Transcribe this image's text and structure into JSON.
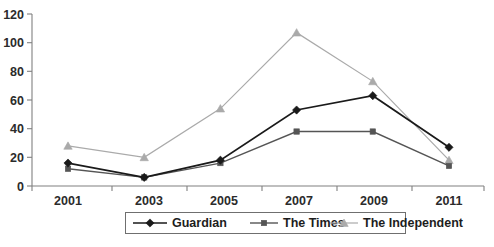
{
  "chart_data": {
    "type": "line",
    "title": "",
    "subtitle": "",
    "xlabel": "",
    "ylabel": "",
    "categories": [
      "2001",
      "2003",
      "2005",
      "2007",
      "2009",
      "2011"
    ],
    "x": [
      2001,
      2003,
      2005,
      2007,
      2009,
      2011
    ],
    "ylim": [
      0,
      120
    ],
    "yticks": [
      0,
      20,
      40,
      60,
      80,
      100,
      120
    ],
    "ytick_labels": [
      "0",
      "20",
      "40",
      "60",
      "80",
      "100",
      "120"
    ],
    "grid": false,
    "legend_position": "bottom",
    "series": [
      {
        "name": "Guardian",
        "marker": "diamond",
        "color": "#1a1a1a",
        "values": [
          16,
          6,
          18,
          53,
          63,
          27
        ]
      },
      {
        "name": "The Times",
        "marker": "square",
        "color": "#555555",
        "values": [
          12,
          6,
          16,
          38,
          38,
          14
        ]
      },
      {
        "name": "The Independent",
        "marker": "triangle",
        "color": "#aaaaaa",
        "values": [
          28,
          20,
          54,
          107,
          73,
          18
        ]
      }
    ]
  },
  "legend": {
    "items": [
      {
        "label": "Guardian"
      },
      {
        "label": "The Times"
      },
      {
        "label": "The Independent"
      }
    ]
  },
  "axes": {
    "y_tick_labels": [
      "120",
      "100",
      "80",
      "60",
      "40",
      "20",
      "0"
    ],
    "x_tick_labels": [
      "2001",
      "2003",
      "2005",
      "2007",
      "2009",
      "2011"
    ]
  }
}
